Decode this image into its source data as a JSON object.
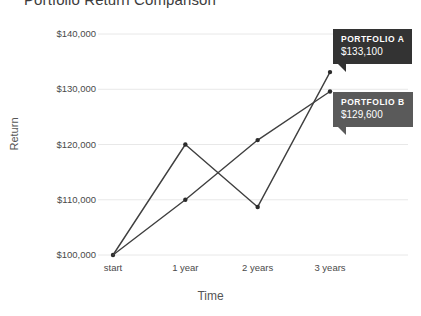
{
  "chart_data": {
    "type": "line",
    "title": "Portfolio Return Comparison",
    "xlabel": "Time",
    "ylabel": "Return",
    "categories": [
      "start",
      "1 year",
      "2 years",
      "3 years"
    ],
    "series": [
      {
        "name": "Portfolio A",
        "values": [
          100000,
          120000,
          108700,
          133100
        ]
      },
      {
        "name": "Portfolio B",
        "values": [
          100000,
          110000,
          120800,
          129600
        ]
      }
    ],
    "ylim": [
      100000,
      140000
    ],
    "y_ticks": [
      100000,
      110000,
      120000,
      130000,
      140000
    ],
    "y_tick_labels": [
      "$100,000",
      "$110,000",
      "$120,000",
      "$130,000",
      "$140,000"
    ],
    "grid": true,
    "legend": "none",
    "annotations": [
      {
        "name": "PORTFOLIO A",
        "value": "$133,100",
        "color": "#333333"
      },
      {
        "name": "PORTFOLIO B",
        "value": "$129,600",
        "color": "#5a5a5a"
      }
    ],
    "line_color": "#3f3f3f",
    "marker_color": "#2b2b2b",
    "grid_color": "#e8e8e8",
    "background": "#ffffff"
  }
}
